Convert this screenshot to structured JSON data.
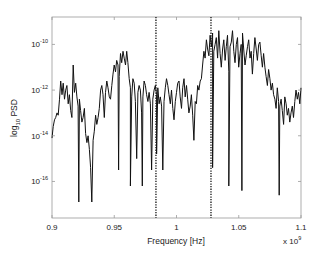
{
  "chart_data": {
    "type": "line",
    "title": "",
    "xlabel": "Frequency [Hz]",
    "ylabel": "log10 PSD",
    "ylabel_parts": {
      "base": "log",
      "sub": "10",
      "rest": " PSD"
    },
    "x_multiplier": {
      "base": "x 10",
      "exp": "9"
    },
    "xlim": [
      0.9,
      1.1
    ],
    "ylim_log10": [
      -17.6,
      -8.8
    ],
    "yscale": "log",
    "grid": false,
    "legend": null,
    "x_ticks": [
      0.9,
      0.95,
      1.0,
      1.05,
      1.1
    ],
    "x_tick_labels": [
      "0.9",
      "0.95",
      "1",
      "1.05",
      "1.1"
    ],
    "y_ticks_log10": [
      -10,
      -12,
      -14,
      -16
    ],
    "y_tick_labels": [
      {
        "base": "10",
        "exp": "-10"
      },
      {
        "base": "10",
        "exp": "-12"
      },
      {
        "base": "10",
        "exp": "-14"
      },
      {
        "base": "10",
        "exp": "-16"
      }
    ],
    "vertical_markers": {
      "style": "dotted",
      "x": [
        0.9835,
        1.0277
      ]
    },
    "series": [
      {
        "name": "PSD",
        "color": "#111111",
        "x": [
          0.9,
          0.901,
          0.902,
          0.903,
          0.904,
          0.905,
          0.906,
          0.907,
          0.908,
          0.909,
          0.91,
          0.911,
          0.912,
          0.913,
          0.914,
          0.915,
          0.916,
          0.917,
          0.918,
          0.919,
          0.92,
          0.921,
          0.922,
          0.923,
          0.924,
          0.925,
          0.926,
          0.927,
          0.928,
          0.929,
          0.93,
          0.931,
          0.932,
          0.933,
          0.934,
          0.935,
          0.936,
          0.937,
          0.938,
          0.939,
          0.94,
          0.941,
          0.942,
          0.943,
          0.944,
          0.945,
          0.946,
          0.947,
          0.948,
          0.949,
          0.95,
          0.951,
          0.952,
          0.953,
          0.954,
          0.955,
          0.956,
          0.957,
          0.958,
          0.959,
          0.96,
          0.961,
          0.962,
          0.963,
          0.964,
          0.965,
          0.966,
          0.967,
          0.968,
          0.969,
          0.97,
          0.971,
          0.972,
          0.973,
          0.974,
          0.975,
          0.976,
          0.977,
          0.978,
          0.979,
          0.98,
          0.981,
          0.982,
          0.983,
          0.984,
          0.985,
          0.986,
          0.987,
          0.988,
          0.989,
          0.99,
          0.991,
          0.992,
          0.993,
          0.994,
          0.995,
          0.996,
          0.997,
          0.998,
          0.999,
          1.0,
          1.001,
          1.002,
          1.003,
          1.004,
          1.005,
          1.006,
          1.007,
          1.008,
          1.009,
          1.01,
          1.011,
          1.012,
          1.013,
          1.014,
          1.015,
          1.016,
          1.017,
          1.018,
          1.019,
          1.02,
          1.021,
          1.022,
          1.023,
          1.024,
          1.025,
          1.026,
          1.027,
          1.028,
          1.029,
          1.03,
          1.031,
          1.032,
          1.033,
          1.034,
          1.035,
          1.036,
          1.037,
          1.038,
          1.039,
          1.04,
          1.041,
          1.042,
          1.043,
          1.044,
          1.045,
          1.046,
          1.047,
          1.048,
          1.049,
          1.05,
          1.051,
          1.052,
          1.053,
          1.054,
          1.055,
          1.056,
          1.057,
          1.058,
          1.059,
          1.06,
          1.061,
          1.062,
          1.063,
          1.064,
          1.065,
          1.066,
          1.067,
          1.068,
          1.069,
          1.07,
          1.071,
          1.072,
          1.073,
          1.074,
          1.075,
          1.076,
          1.077,
          1.078,
          1.079,
          1.08,
          1.081,
          1.082,
          1.083,
          1.084,
          1.085,
          1.086,
          1.087,
          1.088,
          1.089,
          1.09,
          1.091,
          1.092,
          1.093,
          1.094,
          1.095,
          1.096,
          1.097,
          1.098,
          1.099,
          1.1
        ],
        "log10_y": [
          -14.1,
          -13.6,
          -13.3,
          -13.2,
          -13.0,
          -13.1,
          -12.4,
          -11.6,
          -12.2,
          -11.7,
          -12.4,
          -12.0,
          -11.8,
          -12.6,
          -12.2,
          -12.9,
          -13.2,
          -10.9,
          -12.1,
          -11.7,
          -12.3,
          -12.7,
          -12.4,
          -12.9,
          -13.4,
          -13.2,
          -12.8,
          -13.9,
          -14.3,
          -14.0,
          -14.6,
          -15.4,
          -16.9,
          -14.2,
          -13.8,
          -13.1,
          -13.5,
          -13.2,
          -12.8,
          -12.0,
          -11.8,
          -12.2,
          -13.2,
          -12.1,
          -11.6,
          -11.9,
          -12.3,
          -12.4,
          -11.8,
          -11.3,
          -10.9,
          -11.2,
          -10.7,
          -10.9,
          -11.4,
          -10.4,
          -10.8,
          -10.3,
          -10.6,
          -10.9,
          -10.3,
          -10.8,
          -11.5,
          -11.9,
          -12.3,
          -11.5,
          -11.7,
          -12.5,
          -15.0,
          -12.1,
          -11.8,
          -12.0,
          -13.0,
          -12.3,
          -11.6,
          -11.8,
          -12.2,
          -12.5,
          -12.1,
          -12.6,
          -15.5,
          -12.4,
          -12.0,
          -11.8,
          -12.2,
          -11.9,
          -12.6,
          -12.3,
          -12.7,
          -15.5,
          -12.5,
          -11.9,
          -11.5,
          -11.8,
          -12.2,
          -12.6,
          -12.0,
          -12.8,
          -13.3,
          -12.5,
          -12.1,
          -11.7,
          -11.6,
          -12.3,
          -12.8,
          -11.9,
          -11.5,
          -12.3,
          -11.8,
          -12.4,
          -13.0,
          -12.7,
          -12.2,
          -13.1,
          -14.2,
          -12.5,
          -12.6,
          -11.8,
          -12.0,
          -11.6,
          -11.5,
          -10.9,
          -10.3,
          -10.6,
          -9.8,
          -10.2,
          -10.5,
          -9.6,
          -10.1,
          -9.5,
          -10.3,
          -10.0,
          -9.7,
          -10.6,
          -9.4,
          -10.4,
          -11.0,
          -10.2,
          -9.8,
          -10.7,
          -10.1,
          -9.6,
          -11.2,
          -10.1,
          -9.9,
          -9.4,
          -10.3,
          -10.8,
          -10.0,
          -9.7,
          -11.0,
          -10.4,
          -10.0,
          -9.5,
          -10.2,
          -10.9,
          -10.5,
          -10.1,
          -9.8,
          -10.6,
          -10.3,
          -11.3,
          -10.4,
          -9.7,
          -10.2,
          -10.7,
          -10.0,
          -9.9,
          -10.5,
          -11.0,
          -10.4,
          -11.0,
          -11.4,
          -11.8,
          -11.1,
          -11.5,
          -12.0,
          -11.7,
          -12.2,
          -12.4,
          -12.8,
          -11.9,
          -12.5,
          -12.7,
          -12.4,
          -12.9,
          -13.5,
          -12.3,
          -12.6,
          -13.1,
          -12.8,
          -13.4,
          -13.0,
          -12.7,
          -13.2,
          -12.5,
          -12.0,
          -12.4,
          -12.1,
          -12.6,
          -11.9,
          -12.3,
          -12.1,
          -11.7,
          -12.2,
          -11.5,
          -11.8
        ],
        "dips": [
          {
            "x": 0.9215,
            "log10_y": -16.9
          },
          {
            "x": 0.9535,
            "log10_y": -15.5
          },
          {
            "x": 0.963,
            "log10_y": -16.2
          },
          {
            "x": 0.9725,
            "log10_y": -16.2
          },
          {
            "x": 0.984,
            "log10_y": -14.8
          },
          {
            "x": 1.029,
            "log10_y": -15.4
          },
          {
            "x": 1.042,
            "log10_y": -16.2
          },
          {
            "x": 1.0525,
            "log10_y": -16.4
          },
          {
            "x": 1.0825,
            "log10_y": -16.6
          }
        ]
      }
    ]
  }
}
